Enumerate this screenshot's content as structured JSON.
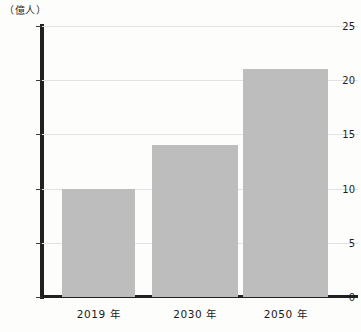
{
  "chart_data": {
    "type": "bar",
    "title": "",
    "xlabel": "",
    "ylabel": "（億人）",
    "unit_label": "（億人）",
    "categories": [
      "2019 年",
      "2030 年",
      "2050 年"
    ],
    "values": [
      10,
      14,
      21
    ],
    "ylim": [
      0,
      25
    ],
    "yticks": [
      0,
      5,
      10,
      15,
      20,
      25
    ],
    "ytick_labels": [
      "0",
      "5",
      "10",
      "15",
      "20",
      "25"
    ],
    "grid": true,
    "grid_axis": "y",
    "legend": null,
    "series": [
      {
        "name": "",
        "values": [
          10,
          14,
          21
        ],
        "color": "#bdbdbd"
      }
    ],
    "colors": {
      "bar_fill": "#bdbdbd",
      "axis": "#202020",
      "gridline": "#e2e2e2",
      "text": "#1a1a1a",
      "background": "#fdfdfb"
    }
  }
}
